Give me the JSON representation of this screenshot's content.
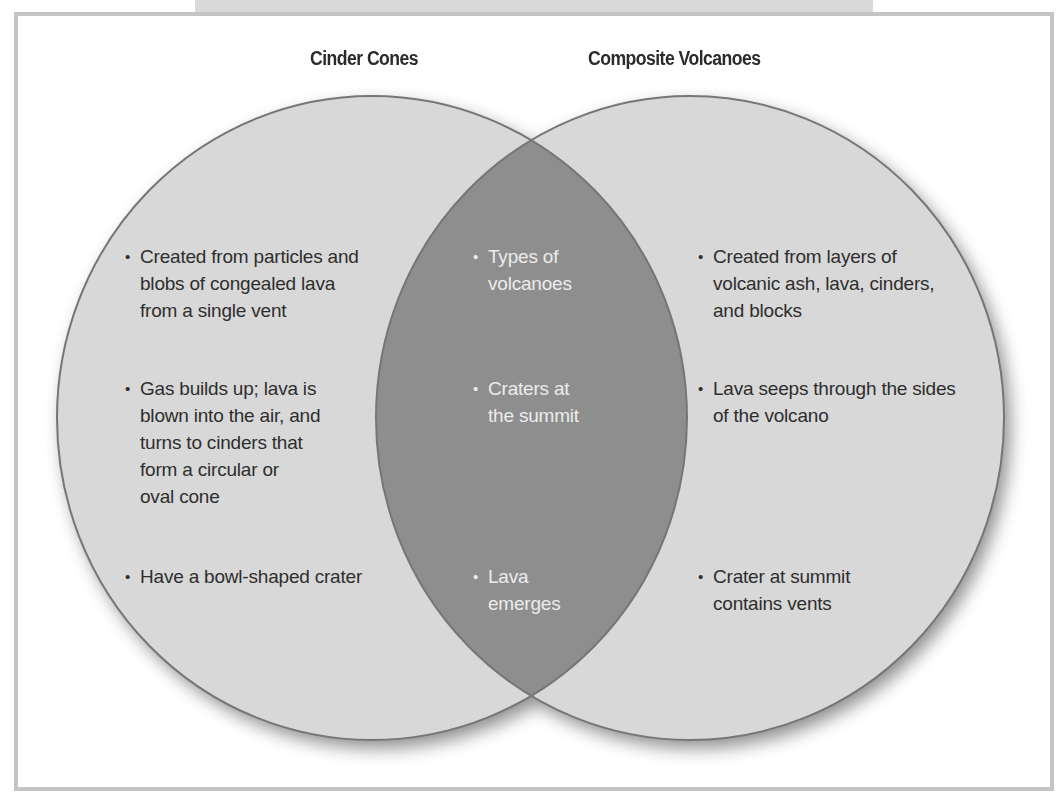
{
  "diagram": {
    "type": "venn",
    "sets": [
      {
        "title": "Cinder Cones",
        "items": [
          {
            "lines": [
              "Created from particles and",
              "blobs of congealed lava",
              "from a single vent"
            ]
          },
          {
            "lines": [
              "Gas builds up; lava is",
              "blown into the air, and",
              "turns to cinders that",
              "form a circular or",
              "oval cone"
            ]
          },
          {
            "lines": [
              "Have a bowl-shaped crater"
            ]
          }
        ]
      },
      {
        "title": "Composite Volcanoes",
        "items": [
          {
            "lines": [
              "Created from layers of",
              "volcanic ash, lava, cinders,",
              "and blocks"
            ]
          },
          {
            "lines": [
              "Lava seeps through the sides",
              "of the volcano"
            ]
          },
          {
            "lines": [
              "Crater at summit",
              "contains vents"
            ]
          }
        ]
      }
    ],
    "overlap": {
      "items": [
        {
          "lines": [
            "Types of",
            "volcanoes"
          ]
        },
        {
          "lines": [
            "Craters at",
            "the summit"
          ]
        },
        {
          "lines": [
            "Lava",
            "emerges"
          ]
        }
      ]
    },
    "bullet": "•",
    "colors": {
      "circle_fill": "#d8d8d8",
      "overlap_fill": "#8e8e8e",
      "outline": "#767676",
      "text_dark": "#2e2e2e",
      "text_light": "#ececec",
      "frame_border": "#c4c4c4"
    }
  }
}
